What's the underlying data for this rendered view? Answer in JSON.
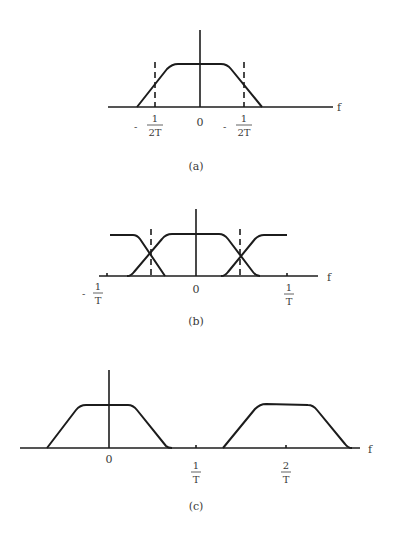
{
  "figure": {
    "panels": [
      {
        "id": "a",
        "caption": "(a)",
        "axis_label": "f",
        "ticks": [
          {
            "sign": "-",
            "num": "1",
            "den": "2T"
          },
          {
            "value": "0"
          },
          {
            "sign": "-",
            "num": "1",
            "den": "2T"
          }
        ]
      },
      {
        "id": "b",
        "caption": "(b)",
        "axis_label": "f",
        "ticks": [
          {
            "sign": "-",
            "num": "1",
            "den": "T"
          },
          {
            "value": "0"
          },
          {
            "sign": "",
            "num": "1",
            "den": "T"
          }
        ]
      },
      {
        "id": "c",
        "caption": "(c)",
        "axis_label": "f",
        "ticks": [
          {
            "value": "0"
          },
          {
            "sign": "",
            "num": "1",
            "den": "T"
          },
          {
            "sign": "",
            "num": "2",
            "den": "T"
          }
        ]
      }
    ]
  }
}
